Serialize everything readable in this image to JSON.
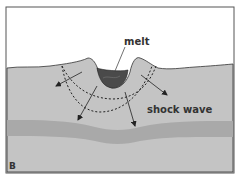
{
  "diagram": {
    "panel_label": "B",
    "labels": {
      "melt": "melt",
      "shock_wave": "shock wave"
    },
    "colors": {
      "ground": "#c4c4c4",
      "layer": "#a9a9a9",
      "melt": "#4a4a4a",
      "sky": "#ffffff",
      "border": "#555555",
      "lines": "#222222"
    }
  }
}
